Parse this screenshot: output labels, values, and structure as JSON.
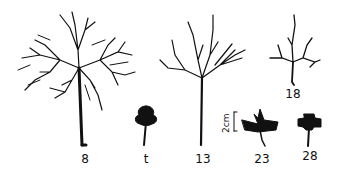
{
  "figure": {
    "specimens": [
      {
        "id": "specimen-8",
        "label": "8",
        "x": 85,
        "y": 153
      },
      {
        "id": "specimen-t",
        "label": "t",
        "x": 146,
        "y": 153
      },
      {
        "id": "specimen-13",
        "label": "13",
        "x": 204,
        "y": 153
      },
      {
        "id": "specimen-18",
        "label": "18",
        "x": 292,
        "y": 90
      },
      {
        "id": "specimen-23",
        "label": "23",
        "x": 262,
        "y": 153
      },
      {
        "id": "specimen-28",
        "label": "28",
        "x": 310,
        "y": 153
      }
    ],
    "scale_bar": {
      "label": "2cm"
    },
    "ink_color": "#111111",
    "background": "#ffffff"
  }
}
